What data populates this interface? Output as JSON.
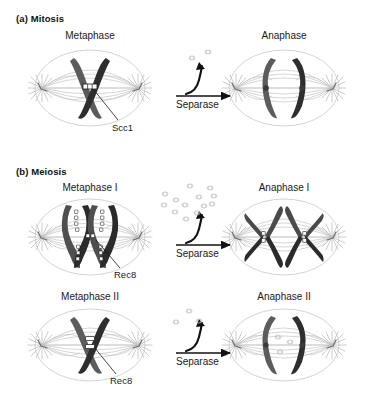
{
  "figure": {
    "sections": [
      {
        "id": "a",
        "label": "(a) Mitosis"
      },
      {
        "id": "b",
        "label": "(b) Meiosis"
      }
    ],
    "panels": [
      {
        "id": "mitosis-metaphase",
        "title": "Metaphase"
      },
      {
        "id": "mitosis-anaphase",
        "title": "Anaphase"
      },
      {
        "id": "meiosis-metaphase-1",
        "title": "Metaphase I"
      },
      {
        "id": "meiosis-anaphase-1",
        "title": "Anaphase I"
      },
      {
        "id": "meiosis-metaphase-2",
        "title": "Metaphase II"
      },
      {
        "id": "meiosis-anaphase-2",
        "title": "Anaphase II"
      }
    ],
    "enzyme_arrows": [
      {
        "id": "arrow-mitosis",
        "label": "Separase"
      },
      {
        "id": "arrow-meiosis-1",
        "label": "Separase"
      },
      {
        "id": "arrow-meiosis-2",
        "label": "Separase"
      }
    ],
    "cohesin_labels": [
      {
        "id": "scc1",
        "label": "Scc1"
      },
      {
        "id": "rec8-1",
        "label": "Rec8"
      },
      {
        "id": "rec8-2",
        "label": "Rec8"
      }
    ],
    "colors": {
      "chromatid_light": "#595959",
      "chromatid_dark": "#2b2b2b",
      "spindle_fiber": "#b9b9b9",
      "cell_outline": "#c9c9c9",
      "cohesin_fill": "#ffffff",
      "cohesin_stroke": "#1a1a1a",
      "fragment": "#c0c0c0",
      "arrow": "#111111",
      "text": "#1a1a1a",
      "background": "#ffffff"
    },
    "fragment_counts": {
      "mitosis": 2,
      "meiosis_one": 13,
      "meiosis_two_released": 3,
      "meiosis_two_interior": 3
    }
  }
}
